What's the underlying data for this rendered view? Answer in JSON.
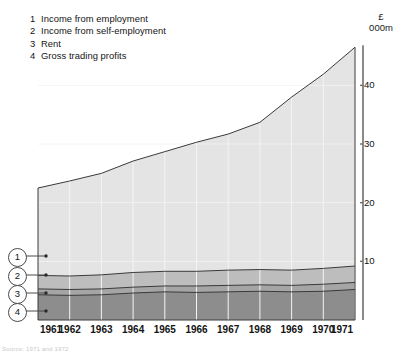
{
  "legend": {
    "items": [
      {
        "num": "1",
        "label": "Income from employment"
      },
      {
        "num": "2",
        "label": "Income from self-employment"
      },
      {
        "num": "3",
        "label": "Rent"
      },
      {
        "num": "4",
        "label": "Gross trading profits"
      }
    ]
  },
  "axis_unit": {
    "currency": "£",
    "scale": "000m"
  },
  "callouts": [
    {
      "num": "1"
    },
    {
      "num": "2"
    },
    {
      "num": "3"
    },
    {
      "num": "4"
    }
  ],
  "footer": {
    "text": "Source: 1971 and 1972"
  },
  "colors": {
    "band_employment": "#e4e4e4",
    "band_self_employment": "#bdbdbd",
    "band_rent": "#a5a5a5",
    "band_trading_profits": "#8d8d8d",
    "outline": "#3a3a3a",
    "gridline": "#f4f4f4",
    "axis": "#6e6e6e",
    "text": "#141414"
  },
  "chart_data": {
    "type": "area",
    "stacked": true,
    "title": "",
    "xlabel": "",
    "ylabel": "£ 000m",
    "x": [
      1961,
      1962,
      1963,
      1964,
      1965,
      1966,
      1967,
      1968,
      1969,
      1970,
      1971
    ],
    "categories": [
      "1961",
      "1962",
      "1963",
      "1964",
      "1965",
      "1966",
      "1967",
      "1968",
      "1969",
      "1970",
      "1971"
    ],
    "xtick_labels": [
      "1961",
      "1962",
      "1963",
      "1964",
      "1965",
      "1966",
      "1967",
      "1968",
      "1969",
      "1970",
      "1971"
    ],
    "ytick_labels": [
      "10",
      "20",
      "30",
      "40"
    ],
    "yticks": [
      10,
      20,
      30,
      40
    ],
    "ylim": [
      0,
      48
    ],
    "xlim": [
      1961,
      1971
    ],
    "grid": true,
    "legend_position": "top-left",
    "stack_order_bottom_to_top": [
      "Gross trading profits",
      "Rent",
      "Income from self-employment",
      "Income from employment"
    ],
    "series": [
      {
        "name": "Gross trading profits",
        "legend_num": "4",
        "color": "#8d8d8d",
        "values": [
          4.3,
          4.2,
          4.3,
          4.6,
          4.8,
          4.7,
          4.8,
          4.9,
          4.8,
          4.9,
          5.2
        ]
      },
      {
        "name": "Rent",
        "legend_num": "3",
        "color": "#a5a5a5",
        "values": [
          1.0,
          1.0,
          1.0,
          1.0,
          1.0,
          1.1,
          1.1,
          1.1,
          1.1,
          1.2,
          1.2
        ]
      },
      {
        "name": "Income from self-employment",
        "legend_num": "2",
        "color": "#bdbdbd",
        "values": [
          2.3,
          2.3,
          2.4,
          2.5,
          2.5,
          2.5,
          2.6,
          2.6,
          2.6,
          2.7,
          2.8
        ]
      },
      {
        "name": "Income from employment",
        "legend_num": "1",
        "color": "#e4e4e4",
        "values": [
          14.9,
          16.2,
          17.3,
          19.0,
          20.4,
          22.0,
          23.2,
          25.1,
          29.5,
          33.1,
          37.3
        ]
      }
    ],
    "cumulative_tops": {
      "Gross trading profits": [
        4.3,
        4.2,
        4.3,
        4.6,
        4.8,
        4.7,
        4.8,
        4.9,
        4.8,
        4.9,
        5.2
      ],
      "Rent": [
        5.3,
        5.2,
        5.3,
        5.6,
        5.8,
        5.8,
        5.9,
        6.0,
        5.9,
        6.1,
        6.4
      ],
      "Income from self-employment": [
        7.6,
        7.5,
        7.7,
        8.1,
        8.3,
        8.3,
        8.5,
        8.6,
        8.5,
        8.8,
        9.2
      ],
      "Income from employment": [
        22.5,
        23.7,
        25.0,
        27.1,
        28.7,
        30.3,
        31.7,
        33.7,
        38.0,
        41.9,
        46.5
      ]
    },
    "totals": [
      22.5,
      23.7,
      25.0,
      27.1,
      28.7,
      30.3,
      31.7,
      33.7,
      38.0,
      41.9,
      46.5
    ]
  },
  "geometry": {
    "plot_left": 38,
    "plot_right": 355,
    "baseline_y": 320,
    "px_per_unit": 5.866,
    "zero_y": 320
  }
}
